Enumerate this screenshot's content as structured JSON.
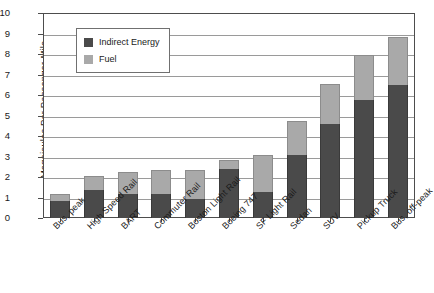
{
  "chart_data": {
    "type": "bar",
    "subtype": "stacked-bar-vertical",
    "title": "",
    "xlabel": "",
    "ylabel": "Megajoules Per Passenger-Mile",
    "ylim": [
      0,
      10
    ],
    "ytick_step": 1,
    "yticks": [
      "10",
      "9",
      "8",
      "7",
      "6",
      "5",
      "4",
      "3",
      "2",
      "1",
      "0"
    ],
    "grid": "horizontal",
    "legend_position": "upper-left-inside",
    "categories": [
      "Bus, peak",
      "High Speed Rail",
      "BART",
      "Commuter Rail",
      "Boston Light Rail",
      "Boeing 747",
      "SF Light Rail",
      "Sedan",
      "SUV",
      "Pickup Truck",
      "Bus, off-peak"
    ],
    "series": [
      {
        "name": "Indirect Energy",
        "color": "#4a4a4a",
        "values": [
          0.85,
          1.38,
          1.18,
          1.18,
          0.95,
          2.38,
          1.28,
          3.08,
          4.58,
          5.78,
          6.48
        ]
      },
      {
        "name": "Fuel",
        "color": "#a9a9a9",
        "values": [
          0.3,
          0.67,
          1.07,
          1.17,
          1.4,
          0.47,
          1.77,
          1.67,
          1.95,
          2.15,
          2.37
        ]
      }
    ],
    "totals": [
      1.15,
      2.05,
      2.25,
      2.35,
      2.35,
      2.85,
      3.05,
      4.75,
      6.53,
      7.93,
      8.85
    ]
  },
  "legend": {
    "entries": [
      {
        "label": "Indirect Energy",
        "color": "#4a4a4a"
      },
      {
        "label": "Fuel",
        "color": "#a9a9a9"
      }
    ]
  }
}
